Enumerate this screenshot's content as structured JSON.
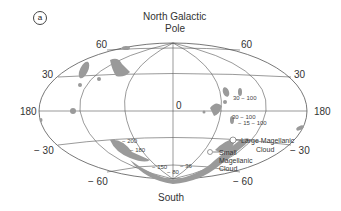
{
  "panel_label": "a",
  "title": {
    "line1": "North Galactic",
    "line2": "Pole"
  },
  "bottom_label": "South",
  "latitude_labels": {
    "left_60": "60",
    "left_30": "30",
    "left_180": "180",
    "left_m30": "− 30",
    "left_m60": "− 60",
    "right_60": "60",
    "right_30": "30",
    "right_180": "180",
    "right_m30": "− 30",
    "right_m60": "− 60",
    "center_0": "0"
  },
  "velocity_labels": [
    "30 − 100",
    "30 − 100",
    "− 15 − 100",
    "− 200",
    "− 180",
    "− 150",
    "− 36",
    "− 80"
  ],
  "annotations": {
    "lmc_line1": "Large Magellanic",
    "lmc_line2": "Cloud",
    "smc_line1": "Small",
    "smc_line2": "Magellanic",
    "smc_line3": "Cloud"
  },
  "colors": {
    "grid": "#555555",
    "clouds": "#9a9a9a",
    "text": "#333333"
  }
}
